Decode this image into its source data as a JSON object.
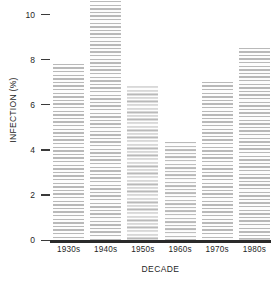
{
  "chart_data": {
    "type": "bar",
    "title": "",
    "xlabel": "DECADE",
    "ylabel": "INFECTION (%)",
    "categories": [
      "1930s",
      "1940s",
      "1950s",
      "1960s",
      "1970s",
      "1980s"
    ],
    "values": [
      7.8,
      10.6,
      6.85,
      4.35,
      7.0,
      8.5
    ],
    "ylim": [
      0,
      10.6
    ],
    "yticks": [
      0,
      2,
      4,
      6,
      8,
      10
    ],
    "ytick_labels": [
      "0",
      "2",
      "4",
      "6",
      "8",
      "10"
    ],
    "grid": false,
    "legend": null,
    "bar_fill": "horizontal-hatch",
    "bar_color": "#b9b9b9",
    "axis_color": "#2a2a2a"
  },
  "axes": {
    "y_title": "INFECTION (%)",
    "x_title": "DECADE"
  }
}
